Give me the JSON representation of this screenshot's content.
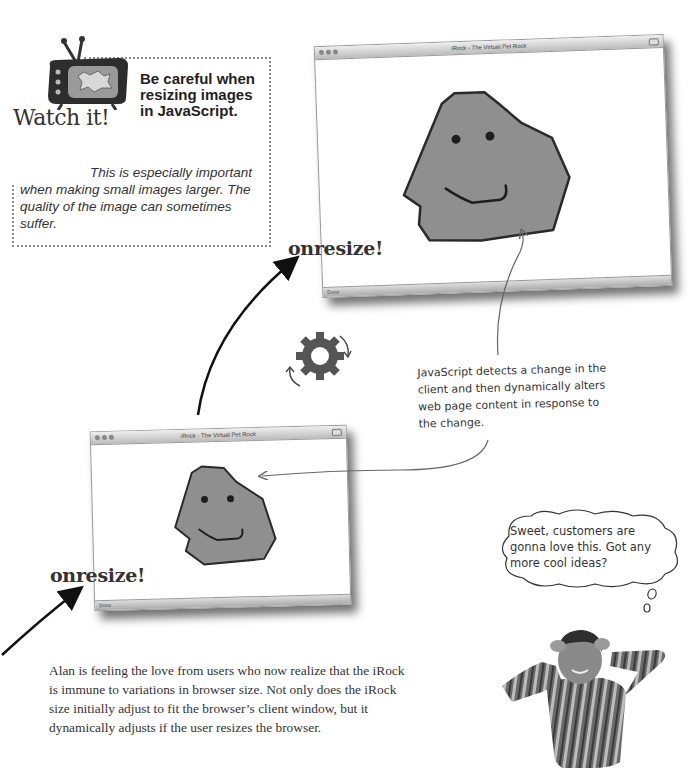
{
  "watch_it": {
    "label": "Watch it!",
    "tv_screen_text": "OWWW",
    "title": "Be careful when resizing images in JavaScript.",
    "body_lead": "This is especially",
    "body_rest": "important when making small images larger. The quality of the image can sometimes suffer."
  },
  "browser_large": {
    "title": "iRock - The Virtual Pet Rock",
    "status": "Done"
  },
  "browser_small": {
    "title": "iRock - The Virtual Pet Rock",
    "status": "Done"
  },
  "event_labels": {
    "top": "onresize!",
    "bottom": "onresize!"
  },
  "annotation": {
    "text": "JavaScript detects a change in the client and then dynamically alters web page content in response to the change."
  },
  "speech_bubble": {
    "text": "Sweet, customers are gonna love this. Got any more cool ideas?"
  },
  "body_paragraph": {
    "text": "Alan is feeling the love from users who now realize that the iRock is immune to variations in browser size. Not only does the iRock size initially adjust to fit the browser’s client window, but it dynamically adjusts if the user resizes the browser."
  },
  "colors": {
    "rock_fill": "#8f8f8f",
    "rock_stroke": "#2a2a2a",
    "gear": "#555555",
    "text": "#333333"
  }
}
